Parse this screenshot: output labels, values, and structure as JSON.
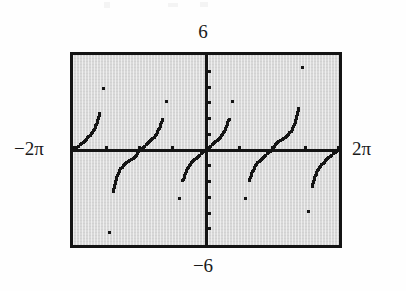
{
  "figure": {
    "title": ""
  },
  "labels": {
    "ymax": "6",
    "ymin": "−6",
    "xmin": "−2π",
    "xmax": "2π"
  },
  "colors": {
    "screen_background": "#d9d9d9",
    "frame": "#141414",
    "axis": "#141414",
    "plot": "#141414",
    "page_background": "#fefefe"
  },
  "chart_data": {
    "type": "scatter",
    "title": "",
    "subtitle": "",
    "xlabel": "",
    "ylabel": "",
    "function": "y = tan(x)",
    "render_style": "dotted-pixel-plot",
    "xlim": [
      -6.283185307,
      6.283185307
    ],
    "ylim": [
      -6,
      6
    ],
    "xlim_label": [
      "−2π",
      "2π"
    ],
    "ylim_label": [
      "−6",
      "6"
    ],
    "grid": false,
    "legend": null,
    "legend_position": "none",
    "axes": {
      "x_axis_visible": true,
      "y_axis_visible": true,
      "x_axis_y_value": 0,
      "y_axis_x_value": 0,
      "x_tick_spacing": 1.570796327,
      "x_tick_spacing_label": "π/2",
      "x_ticks": [
        -6.283185307,
        -4.71238898,
        -3.141592654,
        -1.570796327,
        0,
        1.570796327,
        3.141592654,
        4.71238898,
        6.283185307
      ],
      "y_tick_spacing": 1,
      "y_ticks": [
        -5,
        -4,
        -3,
        -2,
        -1,
        0,
        1,
        2,
        3,
        4,
        5
      ]
    },
    "asymptotes": [
      -4.71238898,
      -1.570796327,
      1.570796327,
      4.71238898
    ],
    "branches": [
      {
        "name": "branch-1",
        "x_range": [
          -6.283185307,
          -4.71238898
        ],
        "points": [
          {
            "x": -6.283185307,
            "y": 0.0
          },
          {
            "x": -6.126105675,
            "y": 0.1577
          },
          {
            "x": -5.969026042,
            "y": 0.3217
          },
          {
            "x": -5.81194641,
            "y": 0.4986
          },
          {
            "x": -5.654866776,
            "y": 0.6967
          },
          {
            "x": -5.497787144,
            "y": 0.9293
          },
          {
            "x": -5.340707511,
            "y": 1.2213
          },
          {
            "x": -5.183627878,
            "y": 1.6319
          },
          {
            "x": -5.026548246,
            "y": 2.313
          },
          {
            "x": -4.869468613,
            "y": 3.895
          }
        ]
      },
      {
        "name": "branch-2",
        "x_range": [
          -4.71238898,
          -1.570796327
        ],
        "points": [
          {
            "x": -4.555309384,
            "y": -5.2422
          },
          {
            "x": -4.398229715,
            "y": -2.6051
          },
          {
            "x": -4.241150082,
            "y": -1.7321
          },
          {
            "x": -4.08407045,
            "y": -1.2799
          },
          {
            "x": -3.926990817,
            "y": -1.0
          },
          {
            "x": -3.769911184,
            "y": -0.8098
          },
          {
            "x": -3.612831552,
            "y": -0.6682
          },
          {
            "x": -3.455751919,
            "y": -0.5095
          },
          {
            "x": -3.298672286,
            "y": -0.3249
          },
          {
            "x": -3.141592654,
            "y": 0.0
          },
          {
            "x": -2.984513021,
            "y": 0.1584
          },
          {
            "x": -2.827433388,
            "y": 0.3249
          },
          {
            "x": -2.670353756,
            "y": 0.5095
          },
          {
            "x": -2.513274123,
            "y": 0.7265
          },
          {
            "x": -2.35619449,
            "y": 1.0
          },
          {
            "x": -2.199114858,
            "y": 1.3764
          },
          {
            "x": -2.042035225,
            "y": 1.9626
          },
          {
            "x": -1.884955592,
            "y": 3.0777
          },
          {
            "x": -1.72787596,
            "y": 6.3138
          }
        ]
      },
      {
        "name": "branch-3",
        "x_range": [
          -1.570796327,
          1.570796327
        ],
        "points": [
          {
            "x": -1.413716694,
            "y": -6.3138
          },
          {
            "x": -1.256637061,
            "y": -3.0777
          },
          {
            "x": -1.099557429,
            "y": -1.9626
          },
          {
            "x": -0.942477796,
            "y": -1.3764
          },
          {
            "x": -0.785398163,
            "y": -1.0
          },
          {
            "x": -0.628318531,
            "y": -0.7265
          },
          {
            "x": -0.471238898,
            "y": -0.5095
          },
          {
            "x": -0.314159265,
            "y": -0.3249
          },
          {
            "x": -0.157079633,
            "y": -0.1584
          },
          {
            "x": 0.0,
            "y": 0.0
          },
          {
            "x": 0.157079633,
            "y": 0.1584
          },
          {
            "x": 0.314159265,
            "y": 0.3249
          },
          {
            "x": 0.471238898,
            "y": 0.5095
          },
          {
            "x": 0.628318531,
            "y": 0.7265
          },
          {
            "x": 0.785398163,
            "y": 1.0
          },
          {
            "x": 0.942477796,
            "y": 1.3764
          },
          {
            "x": 1.099557429,
            "y": 1.9626
          },
          {
            "x": 1.256637061,
            "y": 3.0777
          },
          {
            "x": 1.413716694,
            "y": 6.3138
          }
        ]
      },
      {
        "name": "branch-4",
        "x_range": [
          1.570796327,
          4.71238898
        ],
        "points": [
          {
            "x": 1.72787596,
            "y": -6.3138
          },
          {
            "x": 1.884955592,
            "y": -3.0777
          },
          {
            "x": 2.042035225,
            "y": -1.9626
          },
          {
            "x": 2.199114858,
            "y": -1.3764
          },
          {
            "x": 2.35619449,
            "y": -1.0
          },
          {
            "x": 2.513274123,
            "y": -0.7265
          },
          {
            "x": 2.670353756,
            "y": -0.5095
          },
          {
            "x": 2.827433388,
            "y": -0.3249
          },
          {
            "x": 2.984513021,
            "y": -0.1584
          },
          {
            "x": 3.141592654,
            "y": 0.0
          },
          {
            "x": 3.298672286,
            "y": 0.3249
          },
          {
            "x": 3.455751919,
            "y": 0.5095
          },
          {
            "x": 3.612831552,
            "y": 0.6682
          },
          {
            "x": 3.769911184,
            "y": 0.8098
          },
          {
            "x": 3.926990817,
            "y": 1.0
          },
          {
            "x": 4.08407045,
            "y": 1.2799
          },
          {
            "x": 4.241150082,
            "y": 1.7321
          },
          {
            "x": 4.398229715,
            "y": 2.6051
          },
          {
            "x": 4.555309384,
            "y": 5.2422
          }
        ]
      },
      {
        "name": "branch-5",
        "x_range": [
          4.71238898,
          6.283185307
        ],
        "points": [
          {
            "x": 4.869468613,
            "y": -3.895
          },
          {
            "x": 5.026548246,
            "y": -2.313
          },
          {
            "x": 5.183627878,
            "y": -1.6319
          },
          {
            "x": 5.340707511,
            "y": -1.2213
          },
          {
            "x": 5.497787144,
            "y": -0.9293
          },
          {
            "x": 5.654866776,
            "y": -0.6967
          },
          {
            "x": 5.81194641,
            "y": -0.4986
          },
          {
            "x": 5.969026042,
            "y": -0.3217
          },
          {
            "x": 6.126105675,
            "y": -0.1577
          },
          {
            "x": 6.283185307,
            "y": 0.0
          }
        ]
      }
    ]
  }
}
